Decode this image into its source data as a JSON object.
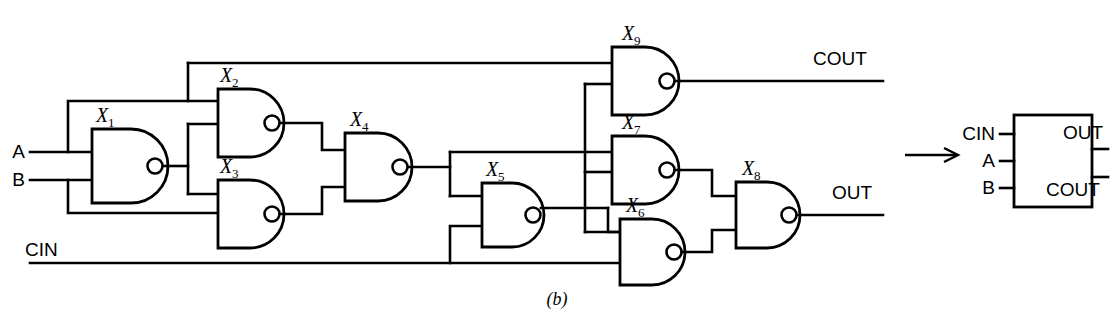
{
  "figure": {
    "caption": "(b)"
  },
  "circuit": {
    "inputs": [
      {
        "id": "A",
        "label": "A"
      },
      {
        "id": "B",
        "label": "B"
      },
      {
        "id": "CIN",
        "label": "CIN"
      }
    ],
    "outputs": [
      {
        "id": "COUT",
        "label": "COUT"
      },
      {
        "id": "OUT",
        "label": "OUT"
      }
    ],
    "gates": [
      {
        "id": "X1",
        "label": "X",
        "sub": "1",
        "type": "nand"
      },
      {
        "id": "X2",
        "label": "X",
        "sub": "2",
        "type": "nand"
      },
      {
        "id": "X3",
        "label": "X",
        "sub": "3",
        "type": "nand"
      },
      {
        "id": "X4",
        "label": "X",
        "sub": "4",
        "type": "nand"
      },
      {
        "id": "X5",
        "label": "X",
        "sub": "5",
        "type": "nand"
      },
      {
        "id": "X6",
        "label": "X",
        "sub": "6",
        "type": "nand"
      },
      {
        "id": "X7",
        "label": "X",
        "sub": "7",
        "type": "nand"
      },
      {
        "id": "X8",
        "label": "X",
        "sub": "8",
        "type": "nand"
      },
      {
        "id": "X9",
        "label": "X",
        "sub": "9",
        "type": "nand"
      }
    ]
  },
  "block_symbol": {
    "inputs": [
      {
        "id": "CIN",
        "label": "CIN"
      },
      {
        "id": "A",
        "label": "A"
      },
      {
        "id": "B",
        "label": "B"
      }
    ],
    "outputs": [
      {
        "id": "OUT",
        "label": "OUT"
      },
      {
        "id": "COUT",
        "label": "COUT"
      }
    ]
  },
  "colors": {
    "line": "#000000",
    "background": "#ffffff",
    "text": "#000000"
  }
}
